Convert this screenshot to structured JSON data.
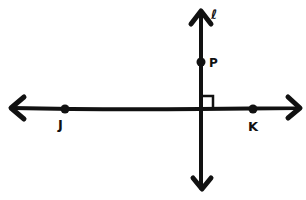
{
  "diagram": {
    "colors": {
      "ink": "#111111",
      "background": "#ffffff"
    },
    "lines": [
      {
        "id": "line-jk",
        "points": [
          "J",
          "K"
        ],
        "orientation": "horizontal",
        "arrows": "both"
      },
      {
        "id": "line-l",
        "label": "ℓ",
        "orientation": "vertical",
        "arrows": "both"
      }
    ],
    "points": [
      {
        "name": "J",
        "label": "J",
        "x": 65,
        "y": 109
      },
      {
        "name": "K",
        "label": "K",
        "x": 253,
        "y": 109
      },
      {
        "name": "P",
        "label": "P",
        "x": 201,
        "y": 62
      }
    ],
    "line_label": "ℓ",
    "right_angle_marker": {
      "at": "intersection",
      "x": 201,
      "y": 108
    }
  }
}
